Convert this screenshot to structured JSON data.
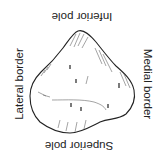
{
  "diagram": {
    "labels": {
      "top": "Inferior pole",
      "bottom": "Superior pole",
      "left": "Lateral border",
      "right": "Medial border"
    },
    "colors": {
      "outline": "#222222",
      "hatch": "#555555",
      "background": "#ffffff"
    }
  }
}
